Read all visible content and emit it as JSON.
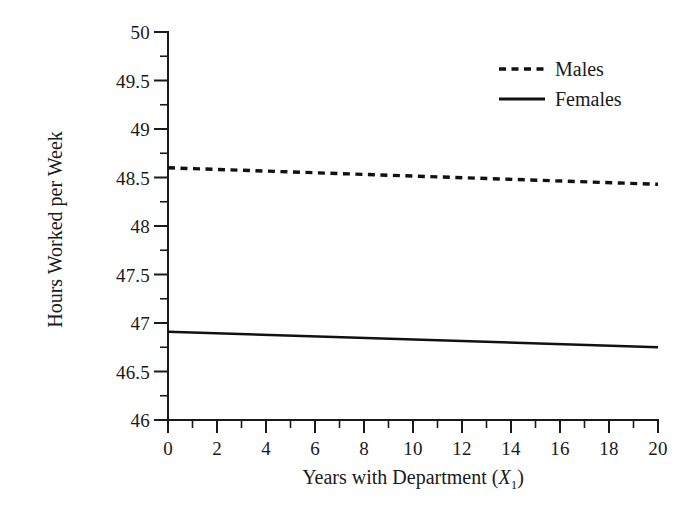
{
  "chart_data": {
    "type": "line",
    "title": "",
    "xlabel": "Years with Department (X1)",
    "ylabel": "Hours Worked per Week",
    "xlim": [
      0,
      20
    ],
    "ylim": [
      46,
      50
    ],
    "grid": false,
    "legend_position": "top-right",
    "x_ticks": [
      0,
      2,
      4,
      6,
      8,
      10,
      12,
      14,
      16,
      18,
      20
    ],
    "x_tick_labels": [
      "0",
      "2",
      "4",
      "6",
      "8",
      "10",
      "12",
      "14",
      "16",
      "18",
      "20"
    ],
    "x_minor_tick_step": 1,
    "y_ticks": [
      46,
      46.5,
      47,
      47.5,
      48,
      48.5,
      49,
      49.5,
      50
    ],
    "y_tick_labels": [
      "46",
      "46.5",
      "47",
      "47.5",
      "48",
      "48.5",
      "49",
      "49.5",
      "50"
    ],
    "y_minor_tick_step": 0.25,
    "series": [
      {
        "name": "Males",
        "style": "dashed",
        "color": "#111111",
        "x": [
          0,
          20
        ],
        "values": [
          48.6,
          48.43
        ]
      },
      {
        "name": "Females",
        "style": "solid",
        "color": "#111111",
        "x": [
          0,
          20
        ],
        "values": [
          46.91,
          46.75
        ]
      }
    ]
  },
  "axes": {
    "y_title": "Hours Worked per Week",
    "x_title_prefix": "Years with Department (",
    "x_title_var": "X",
    "x_title_sub": "1",
    "x_title_suffix": ")"
  },
  "legend": {
    "items": [
      {
        "label": "Males",
        "style": "dashed"
      },
      {
        "label": "Females",
        "style": "solid"
      }
    ]
  }
}
